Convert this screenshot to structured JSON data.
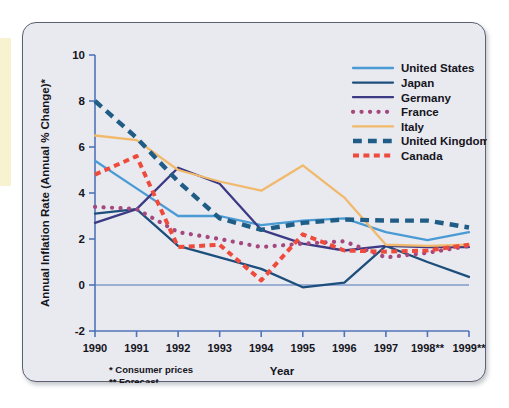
{
  "chart_data": {
    "type": "line",
    "title": "",
    "xlabel": "Year",
    "ylabel": "Annual Inflation Rate (Annual % Change)*",
    "categories": [
      "1990",
      "1991",
      "1992",
      "1993",
      "1994",
      "1995",
      "1996",
      "1997",
      "1998**",
      "1999**"
    ],
    "x_tick_labels": [
      "1990",
      "1991",
      "1992",
      "1993",
      "1994",
      "1995",
      "1996",
      "1997",
      "1998**",
      "1999**"
    ],
    "y_tick_labels": [
      "10",
      "8",
      "6",
      "4",
      "2",
      "0",
      "-2"
    ],
    "ylim": [
      -2,
      10
    ],
    "y_step": 2,
    "grid": false,
    "legend_position": "top-right",
    "footnotes": [
      "* Consumer prices",
      "** Forecast"
    ],
    "series": [
      {
        "name": "United States",
        "color": "#4a9bd4",
        "style": "solid",
        "values": [
          5.4,
          4.2,
          3.0,
          3.0,
          2.6,
          2.8,
          2.9,
          2.3,
          1.95,
          2.3
        ]
      },
      {
        "name": "Japan",
        "color": "#1c4f7c",
        "style": "solid",
        "values": [
          3.1,
          3.3,
          1.7,
          1.2,
          0.7,
          -0.1,
          0.1,
          1.7,
          1.0,
          0.35
        ]
      },
      {
        "name": "Germany",
        "color": "#3c3a85",
        "style": "solid",
        "values": [
          2.7,
          3.3,
          5.1,
          4.4,
          2.4,
          1.8,
          1.5,
          1.7,
          1.65,
          1.65
        ]
      },
      {
        "name": "France",
        "color": "#a4487e",
        "style": "dotted",
        "values": [
          3.4,
          3.3,
          2.3,
          2.0,
          1.65,
          1.8,
          1.9,
          1.2,
          1.4,
          1.7
        ]
      },
      {
        "name": "Italy",
        "color": "#f1b96b",
        "style": "solid",
        "values": [
          6.5,
          6.3,
          5.0,
          4.5,
          4.1,
          5.2,
          3.8,
          1.75,
          1.7,
          1.75
        ]
      },
      {
        "name": "United Kingdom",
        "color": "#1f5d86",
        "style": "dashed",
        "values": [
          8.0,
          6.4,
          4.5,
          2.9,
          2.4,
          2.7,
          2.85,
          2.8,
          2.8,
          2.5
        ]
      },
      {
        "name": "Canada",
        "color": "#ee4b3c",
        "style": "dashed-thick",
        "values": [
          4.8,
          5.6,
          1.65,
          1.75,
          0.2,
          2.2,
          1.5,
          1.45,
          1.5,
          1.75
        ]
      }
    ]
  },
  "legend": {
    "items": [
      {
        "label": "United States",
        "color": "#4a9bd4",
        "style": "solid"
      },
      {
        "label": "Japan",
        "color": "#1c4f7c",
        "style": "solid"
      },
      {
        "label": "Germany",
        "color": "#3c3a85",
        "style": "solid"
      },
      {
        "label": "France",
        "color": "#a4487e",
        "style": "dotted"
      },
      {
        "label": "Italy",
        "color": "#f1b96b",
        "style": "solid"
      },
      {
        "label": "United Kingdom",
        "color": "#1f5d86",
        "style": "dashed"
      },
      {
        "label": "Canada",
        "color": "#ee4b3c",
        "style": "dashed-thick"
      }
    ]
  },
  "axes": {
    "y_title": "Annual Inflation Rate (Annual % Change)*",
    "x_title": "Year"
  },
  "footnotes": {
    "line1": "* Consumer prices",
    "line2": "** Forecast"
  },
  "colors": {
    "card_background": "#e9e9f0",
    "card_border": "#5a6170",
    "axis": "#4f74b8",
    "text": "#15151c",
    "accent_strip": "#f7f2cf"
  }
}
